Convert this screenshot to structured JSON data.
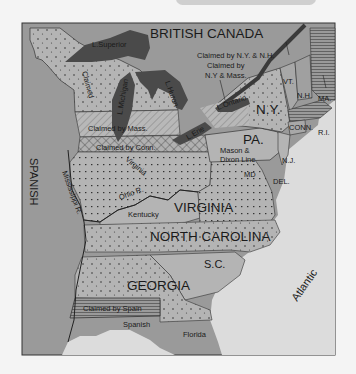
{
  "map": {
    "title_region": "BRITISH CANADA",
    "colors": {
      "page_bg": "#f4f4f4",
      "land_gray": "#9a9a9a",
      "state_light": "#b4b4b4",
      "water_light": "#dcdcdc",
      "lakes_dark": "#4a4a4a",
      "border": "#2a2a2a"
    },
    "regions": {
      "british_canada": "BRITISH CANADA",
      "spanish_west": "SPANISH",
      "spanish_south": "Spanish",
      "florida": "Florida",
      "atlantic": "Atlantic"
    },
    "states": {
      "ny": "N.Y.",
      "pa": "PA.",
      "nj": "N.J.",
      "del": "DEL.",
      "md": "MD",
      "conn": "CONN.",
      "ri": "R.I.",
      "ma": "MA.",
      "nh": "N.H.",
      "vt": "VT.",
      "virginia": "VIRGINIA",
      "north_carolina": "NORTH CAROLINA",
      "sc": "S.C.",
      "georgia": "GEORGIA"
    },
    "claims": {
      "ny_nh": "Claimed by N.Y. & N.H.",
      "ny_mass_line1": "Claimed by",
      "ny_mass_line2": "N.Y & Mass.",
      "mass": "Claimed by Mass.",
      "conn": "Claimed by Conn.",
      "spain": "Claimed by Spain",
      "claimed_nw": "Claimed",
      "virginia_claim": "Virginia",
      "ny_small": "NY"
    },
    "features": {
      "lake_superior": "L.Superior",
      "lake_michigan": "L.Michigan",
      "lake_huron": "L.Huron",
      "lake_erie": "L.Erie",
      "lake_ontario": "L.Ontario",
      "ohio_river": "Ohio R.",
      "mississippi_river": "Mississippi R.",
      "kentucky": "Kentucky",
      "mason_dixon_1": "Mason &",
      "mason_dixon_2": "Dixon Line"
    }
  }
}
